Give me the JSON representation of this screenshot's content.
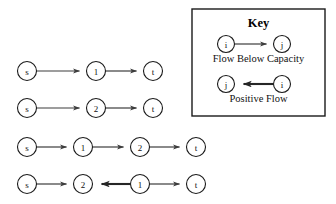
{
  "figure": {
    "type": "flow-network-augmenting-paths",
    "background": "#ffffff",
    "thin_edge_color": "#3c3c3c",
    "thick_edge_color": "#262626",
    "node_stroke_color": "#1a1a1a",
    "node_fill_color": "#ffffff"
  },
  "paths": [
    {
      "id": "path-1",
      "nodes": [
        {
          "label": "s",
          "cx": 27,
          "cy": 71,
          "r": 9.5
        },
        {
          "label": "1",
          "cx": 96,
          "cy": 71,
          "r": 9.5
        },
        {
          "label": "t",
          "cx": 153,
          "cy": 71,
          "r": 9.5
        }
      ],
      "edges": [
        {
          "from": 0,
          "to": 1,
          "direction": "forward",
          "style": "thin"
        },
        {
          "from": 1,
          "to": 2,
          "direction": "forward",
          "style": "thin"
        }
      ]
    },
    {
      "id": "path-2",
      "nodes": [
        {
          "label": "s",
          "cx": 27,
          "cy": 108,
          "r": 9.5
        },
        {
          "label": "2",
          "cx": 96,
          "cy": 108,
          "r": 9.5
        },
        {
          "label": "t",
          "cx": 153,
          "cy": 108,
          "r": 9.5
        }
      ],
      "edges": [
        {
          "from": 0,
          "to": 1,
          "direction": "forward",
          "style": "thin"
        },
        {
          "from": 1,
          "to": 2,
          "direction": "forward",
          "style": "thin"
        }
      ]
    },
    {
      "id": "path-3",
      "nodes": [
        {
          "label": "s",
          "cx": 27,
          "cy": 147,
          "r": 9.5
        },
        {
          "label": "1",
          "cx": 83,
          "cy": 147,
          "r": 9.5
        },
        {
          "label": "2",
          "cx": 140,
          "cy": 147,
          "r": 9.5
        },
        {
          "label": "t",
          "cx": 196,
          "cy": 147,
          "r": 9.5
        }
      ],
      "edges": [
        {
          "from": 0,
          "to": 1,
          "direction": "forward",
          "style": "thin"
        },
        {
          "from": 1,
          "to": 2,
          "direction": "forward",
          "style": "thin"
        },
        {
          "from": 2,
          "to": 3,
          "direction": "forward",
          "style": "thin"
        }
      ]
    },
    {
      "id": "path-4",
      "nodes": [
        {
          "label": "s",
          "cx": 27,
          "cy": 184,
          "r": 9.5
        },
        {
          "label": "2",
          "cx": 83,
          "cy": 184,
          "r": 9.5
        },
        {
          "label": "1",
          "cx": 140,
          "cy": 184,
          "r": 9.5
        },
        {
          "label": "t",
          "cx": 196,
          "cy": 184,
          "r": 9.5
        }
      ],
      "edges": [
        {
          "from": 0,
          "to": 1,
          "direction": "forward",
          "style": "thin"
        },
        {
          "from": 2,
          "to": 1,
          "direction": "backward",
          "style": "thick"
        },
        {
          "from": 2,
          "to": 3,
          "direction": "forward",
          "style": "thin"
        }
      ]
    }
  ],
  "key": {
    "title": "Key",
    "box": {
      "x": 192,
      "y": 9,
      "width": 133,
      "height": 107
    },
    "entries": [
      {
        "caption": "Flow Below Capacity",
        "style": "thin",
        "from_label": "i",
        "to_label": "j",
        "from_cx": 226,
        "to_cx": 282,
        "cy": 44,
        "r": 8.5,
        "caption_y": 62,
        "arrow_direction": "right"
      },
      {
        "caption": "Positive Flow",
        "style": "thick",
        "from_label": "i",
        "to_label": "j",
        "from_cx": 282,
        "to_cx": 226,
        "cy": 84,
        "r": 8.5,
        "caption_y": 102,
        "arrow_direction": "left"
      }
    ]
  }
}
